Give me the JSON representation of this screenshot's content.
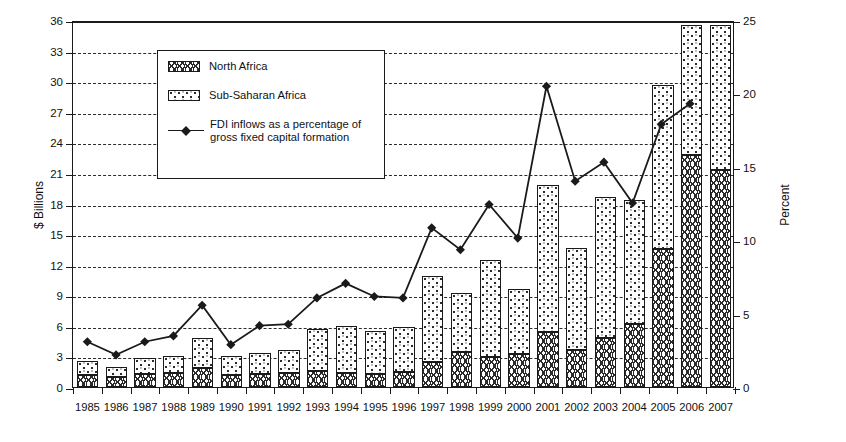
{
  "chart_data": {
    "type": "bar",
    "title": "",
    "subtitle": "",
    "xlabel": "",
    "ylabel": "$ Billions",
    "y2label": "Percent",
    "grid": true,
    "legend_position": "top-left",
    "ylim": [
      0,
      36
    ],
    "ytick_step": 3,
    "y2lim": [
      0,
      25
    ],
    "y2tick_step": 5,
    "yticks": [
      "0",
      "3",
      "6",
      "9",
      "12",
      "15",
      "18",
      "21",
      "24",
      "27",
      "30",
      "33",
      "36"
    ],
    "y2ticks": [
      "0",
      "5",
      "10",
      "15",
      "20",
      "25"
    ],
    "categories": [
      "1985",
      "1986",
      "1987",
      "1988",
      "1989",
      "1990",
      "1991",
      "1992",
      "1993",
      "1994",
      "1995",
      "1996",
      "1997",
      "1998",
      "1999",
      "2000",
      "2001",
      "2002",
      "2003",
      "2004",
      "2005",
      "2006",
      "2007"
    ],
    "series": [
      {
        "name": "North Africa",
        "axis": "left",
        "unit": "$ Billions",
        "stacked": true,
        "fill": "wavy-hatch",
        "values": [
          1.2,
          1.0,
          1.3,
          1.4,
          1.9,
          1.2,
          1.3,
          1.4,
          1.6,
          1.4,
          1.3,
          1.5,
          2.5,
          3.4,
          2.9,
          3.2,
          5.4,
          3.6,
          4.8,
          6.2,
          13.5,
          22.8,
          21.3
        ]
      },
      {
        "name": "Sub-Saharan Africa",
        "axis": "left",
        "unit": "$ Billions",
        "stacked": true,
        "fill": "speckle",
        "values": [
          1.4,
          1.0,
          1.5,
          1.6,
          2.9,
          1.8,
          2.0,
          2.2,
          4.1,
          4.6,
          4.2,
          4.4,
          8.4,
          5.8,
          9.6,
          6.4,
          14.4,
          10.0,
          13.8,
          12.1,
          16.1,
          12.7,
          14.2
        ]
      },
      {
        "name": "FDI inflows as a percentage of gross fixed capital formation",
        "axis": "right",
        "unit": "Percent",
        "type": "line",
        "marker": "diamond",
        "values": [
          3.1,
          2.2,
          3.1,
          3.5,
          5.6,
          2.9,
          4.2,
          4.3,
          6.1,
          7.1,
          6.2,
          6.1,
          10.9,
          9.4,
          12.5,
          10.2,
          20.6,
          14.1,
          15.4,
          12.6,
          18.0,
          19.4,
          null
        ]
      }
    ],
    "bar_totals": [
      2.6,
      2.0,
      2.8,
      3.0,
      4.8,
      3.0,
      3.3,
      3.6,
      5.7,
      6.0,
      5.5,
      5.9,
      10.9,
      9.2,
      12.5,
      9.6,
      19.8,
      13.6,
      18.6,
      18.3,
      29.6,
      35.5,
      35.5
    ],
    "annotations": []
  },
  "legend": {
    "items": [
      {
        "label": "North Africa",
        "marker": "swatch-wavy"
      },
      {
        "label": "Sub-Saharan Africa",
        "marker": "swatch-speckle"
      },
      {
        "label": "FDI inflows as a percentage of\ngross fixed capital formation",
        "label_line1": "FDI inflows as a percentage of",
        "label_line2": "gross fixed capital formation",
        "marker": "line-diamond"
      }
    ]
  },
  "colors": {
    "ink": "#1a1a1a",
    "grid": "#2b2b2b",
    "background": "#ffffff"
  }
}
